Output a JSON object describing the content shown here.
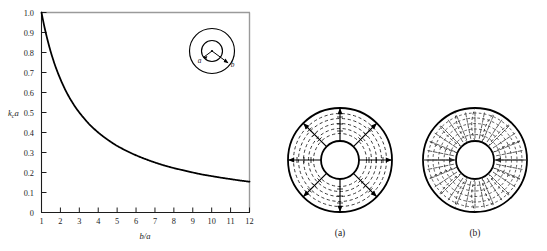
{
  "figure": {
    "caption_labels": {
      "panel_a": "(a)",
      "panel_b": "(b)"
    }
  },
  "chart_data": {
    "type": "line",
    "title": "",
    "subtitle": "",
    "xlabel": "b/a",
    "ylabel": "kca",
    "ylabel_base": "k",
    "ylabel_sub": "c",
    "ylabel_tail": "a",
    "xlim": [
      1,
      12
    ],
    "ylim": [
      0,
      1.0
    ],
    "grid": false,
    "legend": "none",
    "xticks": [
      "1",
      "2",
      "3",
      "4",
      "5",
      "6",
      "7",
      "8",
      "9",
      "10",
      "11",
      "12"
    ],
    "xtick_values": [
      1,
      2,
      3,
      4,
      5,
      6,
      7,
      8,
      9,
      10,
      11,
      12
    ],
    "yticks": [
      "0",
      "0.1",
      "0.2",
      "0.3",
      "0.4",
      "0.5",
      "0.6",
      "0.7",
      "0.8",
      "0.9",
      "1.0"
    ],
    "ytick_values": [
      0,
      0.1,
      0.2,
      0.3,
      0.4,
      0.5,
      0.6,
      0.7,
      0.8,
      0.9,
      1.0
    ],
    "series": [
      {
        "name": "kc a = 2/(1 + b/a)",
        "x": [
          1.0,
          1.25,
          1.5,
          1.75,
          2.0,
          2.25,
          2.5,
          2.75,
          3.0,
          3.25,
          3.5,
          3.75,
          4.0,
          4.5,
          5.0,
          5.5,
          6.0,
          6.5,
          7.0,
          7.5,
          8.0,
          8.5,
          9.0,
          9.5,
          10.0,
          10.5,
          11.0,
          11.5,
          12.0
        ],
        "values": [
          1.0,
          0.889,
          0.8,
          0.727,
          0.667,
          0.615,
          0.571,
          0.533,
          0.5,
          0.471,
          0.444,
          0.421,
          0.4,
          0.364,
          0.333,
          0.308,
          0.286,
          0.267,
          0.25,
          0.235,
          0.222,
          0.211,
          0.2,
          0.19,
          0.182,
          0.174,
          0.167,
          0.16,
          0.154
        ]
      }
    ],
    "annotations": [
      {
        "name": "inset-inner-radius",
        "text": "a"
      },
      {
        "name": "inset-outer-radius",
        "text": "b"
      }
    ]
  },
  "inset": {
    "label_a": "a",
    "label_b": "b"
  },
  "colors": {
    "curve": "#000000",
    "axis": "#1c1c1c",
    "frame": "#9a9a9a",
    "conductor": "#000000",
    "field_solid": "#000000",
    "field_dashed": "#3a3a3a",
    "background": "#ffffff"
  }
}
